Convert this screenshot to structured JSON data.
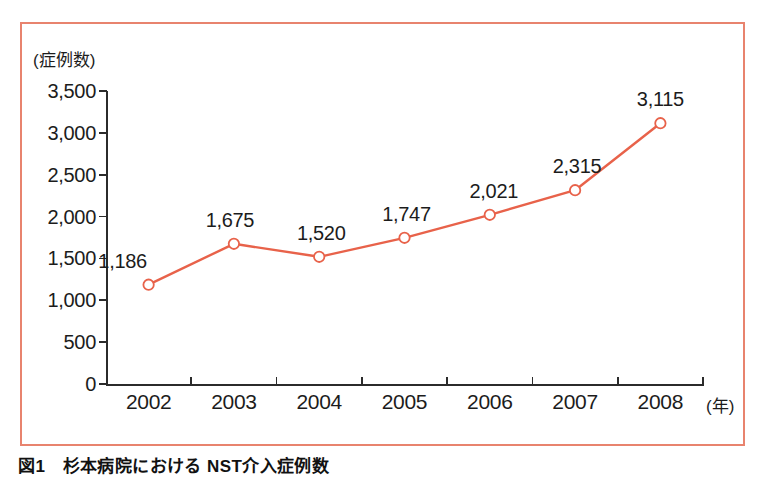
{
  "figure": {
    "frame_color": "#E8836E",
    "caption": "図1　杉本病院における NST介入症例数"
  },
  "chart_data": {
    "type": "line",
    "title": "",
    "subtitle": "",
    "xlabel": "(年)",
    "ylabel": "(症例数)",
    "categories": [
      "2002",
      "2003",
      "2004",
      "2005",
      "2006",
      "2007",
      "2008"
    ],
    "values": [
      1186,
      1675,
      1520,
      1747,
      2021,
      2315,
      3115
    ],
    "value_labels": [
      "1,186",
      "1,675",
      "1,520",
      "1,747",
      "2,021",
      "2,315",
      "3,115"
    ],
    "ylim": [
      0,
      3500
    ],
    "ytick_values": [
      0,
      500,
      1000,
      1500,
      2000,
      2500,
      3000,
      3500
    ],
    "ytick_labels": [
      "0",
      "500",
      "1,000",
      "1,500",
      "2,000",
      "2,500",
      "3,000",
      "3,500"
    ],
    "grid": false,
    "legend": "none",
    "series": [
      {
        "name": "NST介入症例数",
        "values": [
          1186,
          1675,
          1520,
          1747,
          2021,
          2315,
          3115
        ],
        "line_color": "#E8624A",
        "marker": "open-circle",
        "marker_fill": "#ffffff"
      }
    ]
  }
}
